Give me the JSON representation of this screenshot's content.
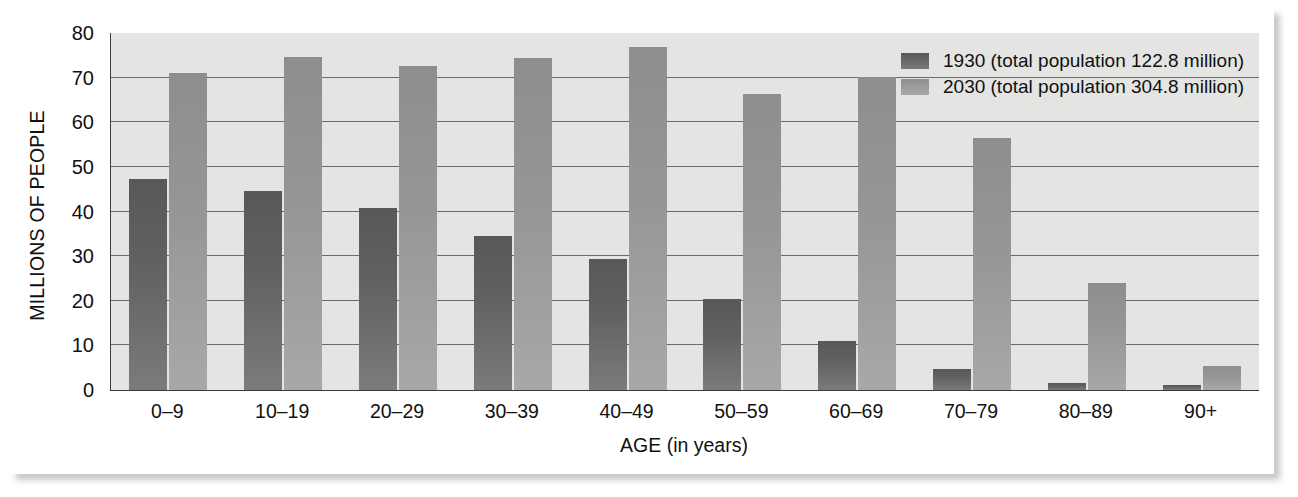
{
  "chart_data": {
    "type": "bar",
    "title": "",
    "xlabel": "AGE (in years)",
    "ylabel": "MILLIONS OF PEOPLE",
    "categories": [
      "0–9",
      "10–19",
      "20–29",
      "30–39",
      "40–49",
      "50–59",
      "60–69",
      "70–79",
      "80–89",
      "90+"
    ],
    "series": [
      {
        "name": "1930 (total population 122.8 million)",
        "short_name": "1930",
        "color": "#5e5e5e",
        "values": [
          47.3,
          44.5,
          40.8,
          34.6,
          29.4,
          20.4,
          11.0,
          4.6,
          1.5,
          1.2
        ]
      },
      {
        "name": "2030 (total population 304.8 million)",
        "short_name": "2030",
        "color": "#9b9b9b",
        "values": [
          71.1,
          74.7,
          72.6,
          74.5,
          76.8,
          66.4,
          70.1,
          56.4,
          24.0,
          5.3
        ]
      }
    ],
    "ylim": [
      0,
      80
    ],
    "yticks": [
      0,
      10,
      20,
      30,
      40,
      50,
      60,
      70,
      80
    ],
    "grid": true,
    "legend_position": "top-right",
    "plot_background": "#e4e4e2"
  },
  "legend": {
    "items": [
      {
        "label": "1930 (total population 122.8 million)"
      },
      {
        "label": "2030 (total population 304.8 million)"
      }
    ]
  }
}
